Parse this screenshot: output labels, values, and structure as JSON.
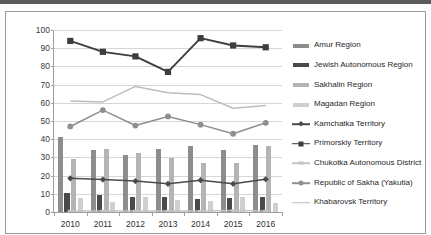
{
  "chart_data": {
    "type": "bar",
    "title": "",
    "subtitle": "",
    "xlabel": "",
    "ylabel": "",
    "categories": [
      "2010",
      "2011",
      "2012",
      "2013",
      "2014",
      "2015",
      "2016"
    ],
    "ylim": [
      0,
      100
    ],
    "ytick_step": 10,
    "ytick_labels": [
      "0",
      "10",
      "20",
      "30",
      "40",
      "50",
      "60",
      "70",
      "80",
      "90",
      "100"
    ],
    "grid": true,
    "legend_position": "right",
    "bar_series": [
      {
        "name": "Amur Region",
        "kind": "bar",
        "color": "#8d8d8d",
        "values": [
          41,
          34,
          31.5,
          34.5,
          36,
          34,
          37
        ]
      },
      {
        "name": "Jewish Autonomous Region",
        "kind": "bar",
        "color": "#4a4a4a",
        "values": [
          10.5,
          9.5,
          8.5,
          8,
          7,
          7.5,
          8.5
        ]
      },
      {
        "name": "Sakhalin Region",
        "kind": "bar",
        "color": "#b4b4b4",
        "values": [
          29,
          34.5,
          32.5,
          29.5,
          27,
          27,
          36
        ]
      },
      {
        "name": "Magadan Region",
        "kind": "bar",
        "color": "#cfcfcf",
        "values": [
          7.5,
          5.5,
          8,
          6.5,
          6,
          8,
          5
        ]
      }
    ],
    "line_series": [
      {
        "name": "Kamchatka Territory",
        "kind": "line",
        "color": "#4b4b4b",
        "marker": "diamond",
        "values": [
          18.5,
          17.8,
          17,
          15.5,
          17.5,
          15.5,
          18
        ]
      },
      {
        "name": "Primorskiy Territory",
        "kind": "line",
        "color": "#3d3d3d",
        "marker": "square",
        "values": [
          94,
          88,
          85.5,
          77,
          95.5,
          91.5,
          90.5
        ]
      },
      {
        "name": "Chukotka Autonomous District",
        "kind": "line",
        "color": "#c4c4c4",
        "marker": "dash",
        "values": [
          0.6,
          0.6,
          0.6,
          0.5,
          0.5,
          0.8,
          0.6
        ]
      },
      {
        "name": "Republic of Sakha (Yakutia)",
        "kind": "line",
        "color": "#8f8f8f",
        "marker": "circle",
        "values": [
          47,
          56,
          47.5,
          52.5,
          48,
          43,
          49
        ]
      },
      {
        "name": "Khabarovsk Territory",
        "kind": "line",
        "color": "#bdbdbd",
        "marker": "none",
        "values": [
          61,
          60.5,
          69,
          65.5,
          64.5,
          57,
          58.5
        ]
      }
    ]
  },
  "legend": {
    "items": [
      {
        "label": "Amur Region"
      },
      {
        "label": "Jewish Autonomous Region"
      },
      {
        "label": "Sakhalin Region"
      },
      {
        "label": "Magadan Region"
      },
      {
        "label": "Kamchatka Territory"
      },
      {
        "label": "Primorskiy Territory"
      },
      {
        "label": "Chukotka Autonomous District"
      },
      {
        "label": "Republic of Sakha (Yakutia)"
      },
      {
        "label": "Khabarovsk Territory"
      }
    ]
  }
}
